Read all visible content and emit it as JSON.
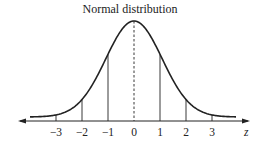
{
  "diagram": {
    "title": "Normal distribution",
    "axis_label": "z",
    "ticks": [
      {
        "label": "−3",
        "value": -3
      },
      {
        "label": "−2",
        "value": -2
      },
      {
        "label": "−1",
        "value": -1
      },
      {
        "label": "0",
        "value": 0
      },
      {
        "label": "1",
        "value": 1
      },
      {
        "label": "2",
        "value": 2
      },
      {
        "label": "3",
        "value": 3
      }
    ],
    "mean_line_style": "dashed",
    "colors": {
      "stroke": "#222222",
      "background": "#ffffff"
    }
  }
}
